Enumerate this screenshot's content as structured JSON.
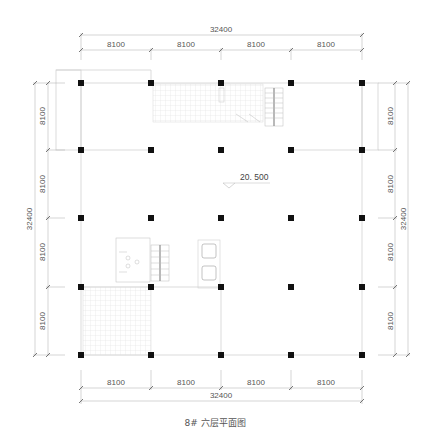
{
  "drawing": {
    "title": "8# 六层平面图",
    "elevation_label": "20. 500",
    "grid": {
      "bay_size_mm": 8100,
      "overall_mm": 32400,
      "columns_x_px": [
        81,
        151,
        221,
        291,
        362
      ],
      "rows_y_px": [
        83,
        150,
        218,
        287,
        355
      ]
    },
    "dimensions": {
      "top": {
        "overall": "32400",
        "bays": [
          "8100",
          "8100",
          "8100",
          "8100"
        ]
      },
      "bottom": {
        "overall": "32400",
        "bays": [
          "8100",
          "8100",
          "8100",
          "8100"
        ]
      },
      "left": {
        "overall": "32400",
        "bays": [
          "8100",
          "8100",
          "8100",
          "8100"
        ]
      },
      "right": {
        "overall": "32400",
        "bays": [
          "8100",
          "8100",
          "8100",
          "8100"
        ]
      }
    },
    "features": [
      {
        "name": "top-hatched-area",
        "description": "grid-hatched zone between columns 2-3, row 1"
      },
      {
        "name": "top-stair",
        "description": "stair near column 4, row 1"
      },
      {
        "name": "left-stair-core",
        "description": "stair and toilet core near column 1-2, row 3"
      },
      {
        "name": "elevators",
        "description": "two elevator shafts near column 3, row 3"
      },
      {
        "name": "bottom-left-hatched-area",
        "description": "grid-hatched zone between columns 1-2, row 4"
      }
    ],
    "colors": {
      "line": "#cfcfcf",
      "dim_line": "#9a9a9a",
      "column": "#111111",
      "text": "#555555",
      "hatch": "#e2e2e2"
    }
  }
}
